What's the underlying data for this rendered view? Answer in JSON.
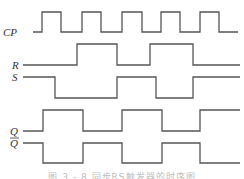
{
  "diagram": {
    "type": "timing-diagram",
    "stroke_color": "#555555",
    "label_color": "#333333",
    "signals": [
      {
        "name": "CP",
        "label": "CP",
        "label_pos": [
          3,
          36
        ],
        "high_y": 12,
        "low_y": 32,
        "start_x": 33,
        "end_x": 238,
        "initial": "low",
        "edges": [
          42,
          61,
          82,
          101,
          122,
          142,
          161,
          180,
          200,
          219
        ]
      },
      {
        "name": "R",
        "label": "R",
        "label_pos": [
          12,
          69
        ],
        "high_y": 44,
        "low_y": 65,
        "start_x": 23,
        "end_x": 240,
        "initial": "low",
        "edges": [
          77,
          117,
          150,
          193
        ]
      },
      {
        "name": "S",
        "label": "S",
        "label_pos": [
          12,
          81
        ],
        "high_y": 77,
        "low_y": 98,
        "start_x": 23,
        "end_x": 240,
        "initial": "high",
        "edges": [
          55,
          117,
          156,
          193
        ]
      },
      {
        "name": "Q",
        "label": "Q",
        "label_pos": [
          10,
          135
        ],
        "high_y": 110,
        "low_y": 131,
        "start_x": 23,
        "end_x": 240,
        "initial": "low",
        "edges": [
          43,
          83,
          122,
          162,
          200
        ]
      },
      {
        "name": "Q-bar",
        "label": "Q",
        "overbar": true,
        "label_pos": [
          10,
          147
        ],
        "high_y": 143,
        "low_y": 163,
        "start_x": 23,
        "end_x": 240,
        "initial": "high",
        "edges": [
          43,
          83,
          122,
          162,
          200
        ]
      }
    ],
    "caption": "图 3 - 8   同步RS触发器的时序图"
  }
}
